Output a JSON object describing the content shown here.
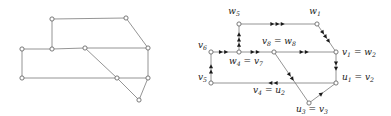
{
  "figure": {
    "panels": [
      {
        "name": "left-panel",
        "caption": "",
        "type": "undirected-graph"
      },
      {
        "name": "right-panel",
        "caption": "",
        "type": "directed-graph"
      }
    ]
  },
  "colors": {
    "edge": "#7a7a7a",
    "node_stroke": "#6b6b6b",
    "node_fill": "#ffffff",
    "arrow": "#1a1a1a",
    "label": "#1a1a1a",
    "background": "#ffffff"
  },
  "left_graph": {
    "nodes": [
      {
        "id": "a",
        "x": 52,
        "y": 19
      },
      {
        "id": "b",
        "x": 126,
        "y": 18
      },
      {
        "id": "c",
        "x": 22,
        "y": 49
      },
      {
        "id": "d",
        "x": 52,
        "y": 49
      },
      {
        "id": "e",
        "x": 85,
        "y": 48
      },
      {
        "id": "f",
        "x": 148,
        "y": 48
      },
      {
        "id": "g",
        "x": 22,
        "y": 78
      },
      {
        "id": "h",
        "x": 117,
        "y": 78
      },
      {
        "id": "i",
        "x": 148,
        "y": 78
      },
      {
        "id": "j",
        "x": 139,
        "y": 100
      }
    ],
    "edges": [
      [
        "a",
        "b"
      ],
      [
        "a",
        "d"
      ],
      [
        "b",
        "f"
      ],
      [
        "c",
        "d"
      ],
      [
        "d",
        "e"
      ],
      [
        "e",
        "f"
      ],
      [
        "e",
        "h"
      ],
      [
        "c",
        "g"
      ],
      [
        "g",
        "h"
      ],
      [
        "h",
        "i"
      ],
      [
        "f",
        "i"
      ],
      [
        "h",
        "j"
      ],
      [
        "i",
        "j"
      ]
    ]
  },
  "right_graph": {
    "nodes": [
      {
        "id": "w5",
        "x": 43,
        "y": 24,
        "label": "w",
        "sub": "5",
        "label2": "",
        "sub2": "",
        "lx": 38,
        "ly": 14,
        "anchor": "middle"
      },
      {
        "id": "w1",
        "x": 121,
        "y": 24,
        "label": "w",
        "sub": "1",
        "label2": "",
        "sub2": "",
        "lx": 119,
        "ly": 14,
        "anchor": "middle"
      },
      {
        "id": "v6",
        "x": 15,
        "y": 52,
        "label": "v",
        "sub": "6",
        "label2": "",
        "sub2": "",
        "lx": 11,
        "ly": 48,
        "anchor": "end"
      },
      {
        "id": "w4v7",
        "x": 43,
        "y": 52,
        "label": "w",
        "sub": "4",
        "label2": "v",
        "sub2": "7",
        "lx": 33,
        "ly": 64,
        "anchor": "start"
      },
      {
        "id": "v8w8",
        "x": 78,
        "y": 52,
        "label": "v",
        "sub": "8",
        "label2": "w",
        "sub2": "8",
        "lx": 66,
        "ly": 44,
        "anchor": "start"
      },
      {
        "id": "v1w2",
        "x": 140,
        "y": 52,
        "label": "v",
        "sub": "1",
        "label2": "w",
        "sub2": "2",
        "lx": 146,
        "ly": 55,
        "anchor": "start"
      },
      {
        "id": "v5",
        "x": 15,
        "y": 83,
        "label": "v",
        "sub": "5",
        "label2": "",
        "sub2": "",
        "lx": 11,
        "ly": 80,
        "anchor": "end"
      },
      {
        "id": "u1v2",
        "x": 140,
        "y": 83,
        "label": "u",
        "sub": "1",
        "label2": "v",
        "sub2": "2",
        "lx": 146,
        "ly": 80,
        "anchor": "start"
      },
      {
        "id": "u3v3",
        "x": 113,
        "y": 103,
        "label": "u",
        "sub": "3",
        "label2": "v",
        "sub2": "3",
        "lx": 100,
        "ly": 112,
        "anchor": "start"
      }
    ],
    "mid_labels": [
      {
        "id": "v4u2",
        "label": "v",
        "sub": "4",
        "label2": "u",
        "sub2": "2",
        "lx": 57,
        "ly": 93,
        "anchor": "start"
      }
    ],
    "edges": [
      {
        "from": "w5",
        "to": "w1",
        "arrows": 3,
        "dir": "forward"
      },
      {
        "from": "w4v7",
        "to": "w5",
        "arrows": 3,
        "dir": "forward"
      },
      {
        "from": "w1",
        "to": "v1w2",
        "arrows": 3,
        "dir": "forward"
      },
      {
        "from": "v6",
        "to": "w4v7",
        "arrows": 2,
        "dir": "forward"
      },
      {
        "from": "w4v7",
        "to": "v8w8",
        "arrows": 2,
        "dir": "forward"
      },
      {
        "from": "v8w8",
        "to": "v1w2",
        "arrows": 2,
        "dir": "forward"
      },
      {
        "from": "v5",
        "to": "v6",
        "arrows": 2,
        "dir": "forward"
      },
      {
        "from": "u1v2",
        "to": "v5",
        "arrows": 2,
        "dir": "forward"
      },
      {
        "from": "v1w2",
        "to": "u1v2",
        "arrows": 2,
        "dir": "forward"
      },
      {
        "from": "v8w8",
        "to": "u3v3",
        "arrows": 2,
        "dir": "forward"
      },
      {
        "from": "u3v3",
        "to": "u1v2",
        "arrows": 1,
        "dir": "forward"
      }
    ]
  }
}
